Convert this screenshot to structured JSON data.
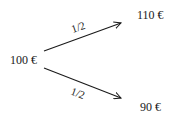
{
  "diagram": {
    "type": "probability-tree",
    "root": {
      "label": "100 €"
    },
    "branches": [
      {
        "probability": "1/2",
        "outcome": "110 €"
      },
      {
        "probability": "1/2",
        "outcome": "90 €"
      }
    ],
    "colors": {
      "ink": "#1a1a1a",
      "background": "#ffffff"
    }
  }
}
